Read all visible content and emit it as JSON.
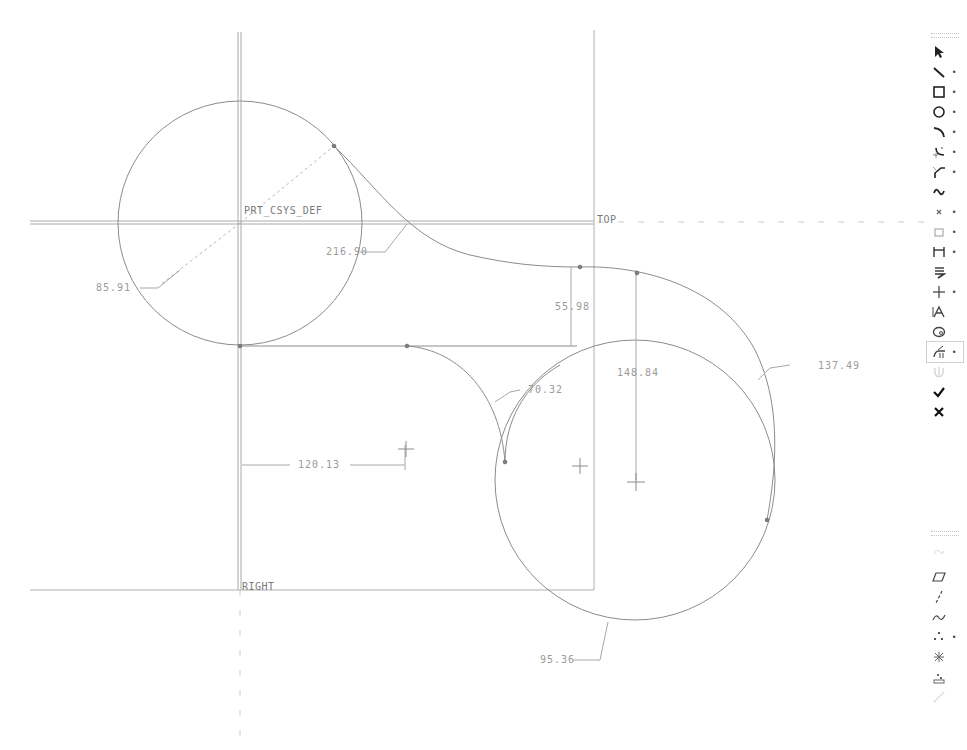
{
  "app": {
    "mode": "Sketcher"
  },
  "canvas": {
    "datums": {
      "csys": "PRT_CSYS_DEF",
      "top": "TOP",
      "right": "RIGHT"
    },
    "dimensions": [
      {
        "id": "d1",
        "label": "216.90",
        "kind": "radius"
      },
      {
        "id": "d2",
        "label": "85.91",
        "kind": "radius"
      },
      {
        "id": "d3",
        "label": "55.98",
        "kind": "linear-vertical"
      },
      {
        "id": "d4",
        "label": "148.84",
        "kind": "linear-vertical"
      },
      {
        "id": "d5",
        "label": "137.49",
        "kind": "radius"
      },
      {
        "id": "d6",
        "label": "70.32",
        "kind": "radius"
      },
      {
        "id": "d7",
        "label": "120.13",
        "kind": "linear-horizontal"
      },
      {
        "id": "d8",
        "label": "95.36",
        "kind": "radius"
      }
    ],
    "colors": {
      "geometry": "#8c8c8c",
      "datum": "#a0a0a0",
      "dimension": "#9a9a9a",
      "background": "#ffffff"
    }
  },
  "toolbar": {
    "groups": [
      {
        "name": "sketch-tools",
        "items": [
          {
            "name": "select",
            "icon": "select-arrow-icon",
            "label": "Select",
            "has_flyout": false,
            "enabled": true
          },
          {
            "name": "line",
            "icon": "line-icon",
            "label": "Line",
            "has_flyout": true,
            "enabled": true
          },
          {
            "name": "rectangle",
            "icon": "rectangle-icon",
            "label": "Rectangle",
            "has_flyout": true,
            "enabled": true
          },
          {
            "name": "circle",
            "icon": "circle-icon",
            "label": "Circle",
            "has_flyout": true,
            "enabled": true
          },
          {
            "name": "arc",
            "icon": "arc-icon",
            "label": "Arc",
            "has_flyout": true,
            "enabled": true
          },
          {
            "name": "fillet",
            "icon": "fillet-icon",
            "label": "Fillet",
            "has_flyout": true,
            "enabled": true
          },
          {
            "name": "chamfer",
            "icon": "chamfer-icon",
            "label": "Chamfer",
            "has_flyout": true,
            "enabled": true
          },
          {
            "name": "spline",
            "icon": "spline-icon",
            "label": "Spline",
            "has_flyout": false,
            "enabled": true
          },
          {
            "name": "point",
            "icon": "point-icon",
            "label": "Point",
            "has_flyout": true,
            "enabled": true
          },
          {
            "name": "use-edge",
            "icon": "use-edge-icon",
            "label": "Use Edge",
            "has_flyout": true,
            "enabled": true
          },
          {
            "name": "dimension",
            "icon": "dimension-icon",
            "label": "Dimension",
            "has_flyout": true,
            "enabled": true
          },
          {
            "name": "modify",
            "icon": "modify-icon",
            "label": "Modify",
            "has_flyout": false,
            "enabled": true
          },
          {
            "name": "constraints",
            "icon": "constraints-icon",
            "label": "Constraints",
            "has_flyout": true,
            "enabled": true
          },
          {
            "name": "text",
            "icon": "text-icon",
            "label": "Text",
            "has_flyout": false,
            "enabled": true
          },
          {
            "name": "palette",
            "icon": "palette-icon",
            "label": "Palette",
            "has_flyout": false,
            "enabled": true
          },
          {
            "name": "trim",
            "icon": "trim-icon",
            "label": "Dynamic Trim",
            "has_flyout": true,
            "enabled": true
          },
          {
            "name": "mirror",
            "icon": "mirror-icon",
            "label": "Mirror",
            "has_flyout": false,
            "enabled": false
          },
          {
            "name": "accept",
            "icon": "checkmark-icon",
            "label": "Done",
            "has_flyout": false,
            "enabled": true
          },
          {
            "name": "cancel",
            "icon": "close-icon",
            "label": "Quit",
            "has_flyout": false,
            "enabled": true
          }
        ]
      },
      {
        "name": "datum-tools",
        "items": [
          {
            "name": "datum-curve-sketch",
            "icon": "sketch-curve-icon",
            "label": "Sketched Curve",
            "has_flyout": false,
            "enabled": false
          },
          {
            "name": "datum-plane",
            "icon": "datum-plane-icon",
            "label": "Datum Plane",
            "has_flyout": false,
            "enabled": true
          },
          {
            "name": "datum-axis",
            "icon": "datum-axis-icon",
            "label": "Datum Axis",
            "has_flyout": false,
            "enabled": true
          },
          {
            "name": "datum-curve",
            "icon": "datum-curve-icon",
            "label": "Datum Curve",
            "has_flyout": false,
            "enabled": true
          },
          {
            "name": "datum-point",
            "icon": "datum-point-icon",
            "label": "Datum Point",
            "has_flyout": true,
            "enabled": true
          },
          {
            "name": "csys",
            "icon": "coordinate-system-icon",
            "label": "Coordinate System",
            "has_flyout": false,
            "enabled": true
          },
          {
            "name": "analysis-feature",
            "icon": "analysis-icon",
            "label": "Analysis Feature",
            "has_flyout": false,
            "enabled": true
          },
          {
            "name": "datum-other",
            "icon": "datum-misc-icon",
            "label": "Datum Feature",
            "has_flyout": false,
            "enabled": false
          }
        ]
      }
    ]
  }
}
